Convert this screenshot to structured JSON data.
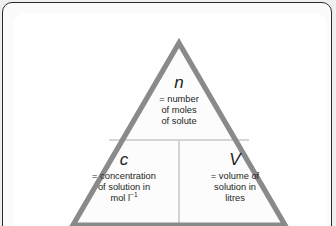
{
  "figure": {
    "kind": "formula-triangle",
    "relationship": "n = c × V",
    "colors": {
      "triangle_outline": "#8a8a8a",
      "divider": "#c9c9c9",
      "text": "#231f20",
      "card_background": "#ffffff",
      "page_background": "#efefef",
      "frame_border": "#2b2b2b"
    }
  },
  "triangle": {
    "top": {
      "symbol": "n",
      "lines": [
        "= number",
        "of moles",
        "of solute"
      ]
    },
    "bottom_left": {
      "symbol": "c",
      "lines": [
        "= concentration",
        "of solution in",
        "mol l"
      ],
      "last_line_superscript": "−1"
    },
    "bottom_right": {
      "symbol": "V",
      "lines": [
        "= volume of",
        "solution in",
        "litres"
      ]
    }
  }
}
